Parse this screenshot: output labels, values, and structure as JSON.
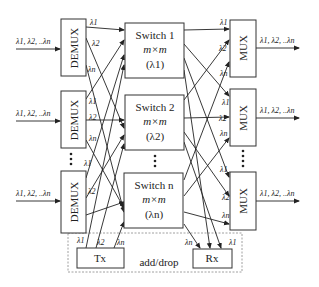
{
  "diagram": {
    "type": "wavelength-routing-oadm",
    "inputs": [
      {
        "label": "λ1, λ2, ..λn"
      },
      {
        "label": "λ1, λ2, ..λn"
      },
      {
        "label": "λ1, λ2, ..λn"
      }
    ],
    "outputs": [
      {
        "label": "λ1, λ2, ..λn"
      },
      {
        "label": "λ1, λ2, ..λn"
      },
      {
        "label": "λ1, λ2, ..λn"
      }
    ],
    "demux": [
      {
        "label": "DEMUX"
      },
      {
        "label": "DEMUX"
      },
      {
        "label": "DEMUX"
      }
    ],
    "mux": [
      {
        "label": "MUX"
      },
      {
        "label": "MUX"
      },
      {
        "label": "MUX"
      }
    ],
    "switches": [
      {
        "title": "Switch 1",
        "size": "m×m",
        "wavelength": "(λ1)"
      },
      {
        "title": "Switch 2",
        "size": "m×m",
        "wavelength": "(λ2)"
      },
      {
        "title": "Switch n",
        "size": "m×m",
        "wavelength": "(λn)"
      }
    ],
    "port_labels": {
      "l1": "λ1",
      "l2": "λ2",
      "ln": "λn"
    },
    "add_drop": {
      "label": "add/drop",
      "tx": "Tx",
      "rx": "Rx"
    }
  }
}
